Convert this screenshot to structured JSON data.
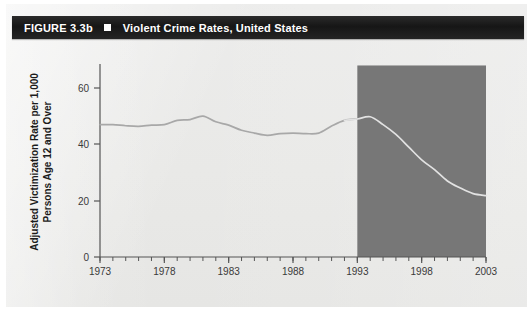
{
  "header": {
    "figure_number": "FIGURE 3.3b",
    "bullet_icon": "filled-square-icon",
    "title": "Violent Crime Rates, United States"
  },
  "source_note": "",
  "colors": {
    "header_bar": "#161616",
    "page_background": "#e9e9e7",
    "shaded_region": "#777777",
    "line_outside": "#a8a8a8",
    "line_inside": "#e2e2e2",
    "axis": "#555555",
    "tick_label": "#3a3a3a"
  },
  "chart_data": {
    "type": "line",
    "title": "Violent Crime Rates, United States",
    "xlabel": "",
    "ylabel": "Adjusted Victimization Rate per 1,000 Persons Age 12 and Over",
    "xlim": [
      1973,
      2003
    ],
    "ylim": [
      0,
      68
    ],
    "ytick_labels": [
      "0",
      "20",
      "40",
      "60"
    ],
    "yticks": [
      0,
      20,
      40,
      60
    ],
    "xtick_labels": [
      "1973",
      "1978",
      "1983",
      "1988",
      "1993",
      "1998",
      "2003"
    ],
    "xticks": [
      1973,
      1978,
      1983,
      1988,
      1993,
      1998,
      2003
    ],
    "minor_xtick_interval": 1,
    "grid": false,
    "legend": null,
    "annotations": [
      {
        "type": "shaded-region",
        "x_start": 1993,
        "x_end": 2003,
        "y_start": 0,
        "y_end": 68,
        "color": "#777777"
      }
    ],
    "x": [
      1973,
      1974,
      1975,
      1976,
      1977,
      1978,
      1979,
      1980,
      1981,
      1982,
      1983,
      1984,
      1985,
      1986,
      1987,
      1988,
      1989,
      1990,
      1991,
      1992,
      1993,
      1994,
      1995,
      1996,
      1997,
      1998,
      1999,
      2000,
      2001,
      2002,
      2003
    ],
    "values": [
      47.0,
      47.0,
      46.6,
      46.4,
      46.8,
      47.0,
      48.5,
      48.8,
      50.0,
      48.0,
      46.8,
      45.0,
      44.0,
      43.2,
      43.8,
      44.0,
      43.8,
      44.0,
      46.5,
      48.5,
      49.0,
      49.8,
      47.0,
      43.5,
      39.0,
      34.5,
      31.0,
      27.0,
      24.5,
      22.5,
      21.8
    ],
    "series_name": "Adjusted victimization rate",
    "value_at_1973": 47.0,
    "value_at_1981_peak": 50.0,
    "value_at_1986_trough": 43.2,
    "value_at_1994_peak": 49.8,
    "value_at_2003": 21.8
  }
}
